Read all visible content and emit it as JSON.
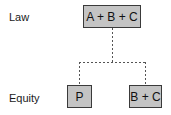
{
  "rows": {
    "law_label": "Law",
    "equity_label": "Equity"
  },
  "nodes": {
    "root": "A + B + C",
    "left_child": "P",
    "right_child": "B + C"
  },
  "colors": {
    "box_fill": "#c4c4c4",
    "box_border": "#3a3a3a",
    "connector": "#555555"
  }
}
